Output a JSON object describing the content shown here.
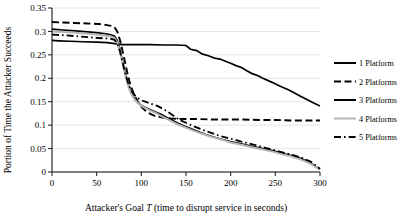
{
  "chart_data": {
    "type": "line",
    "title": "",
    "xlabel": "Attacker's Goal T (time to disrupt service in seconds)",
    "xlabel_parts": {
      "pre": "Attacker's Goal ",
      "italic": "T",
      "post": " (time to disrupt service in seconds)"
    },
    "ylabel": "Portion of Time the Attacker Succeeds",
    "xlim": [
      0,
      300
    ],
    "ylim": [
      0,
      0.35
    ],
    "xticks": [
      0,
      50,
      100,
      150,
      200,
      250,
      300
    ],
    "xticklabels": [
      "0",
      "50",
      "100",
      "150",
      "200",
      "250",
      "300"
    ],
    "yticks": [
      0,
      0.05,
      0.1,
      0.15,
      0.2,
      0.25,
      0.3,
      0.35
    ],
    "yticklabels": [
      "0",
      "0.05",
      "0.1",
      "0.15",
      "0.2",
      "0.25",
      "0.3",
      "0.35"
    ],
    "grid": "horizontal",
    "legend_position": "right",
    "series": [
      {
        "name": "1 Platform",
        "style": "solid",
        "color": "#000000",
        "width": 1.7,
        "points": [
          [
            0,
            0.281
          ],
          [
            8,
            0.28
          ],
          [
            20,
            0.279
          ],
          [
            35,
            0.278
          ],
          [
            50,
            0.277
          ],
          [
            62,
            0.276
          ],
          [
            70,
            0.274
          ],
          [
            78,
            0.272
          ],
          [
            95,
            0.272
          ],
          [
            110,
            0.272
          ],
          [
            125,
            0.271
          ],
          [
            140,
            0.271
          ],
          [
            150,
            0.27
          ],
          [
            155,
            0.262
          ],
          [
            162,
            0.259
          ],
          [
            168,
            0.252
          ],
          [
            175,
            0.248
          ],
          [
            182,
            0.243
          ],
          [
            188,
            0.241
          ],
          [
            195,
            0.236
          ],
          [
            200,
            0.232
          ],
          [
            206,
            0.227
          ],
          [
            212,
            0.223
          ],
          [
            218,
            0.216
          ],
          [
            224,
            0.21
          ],
          [
            230,
            0.206
          ],
          [
            236,
            0.2
          ],
          [
            242,
            0.195
          ],
          [
            248,
            0.19
          ],
          [
            252,
            0.186
          ],
          [
            258,
            0.181
          ],
          [
            264,
            0.176
          ],
          [
            270,
            0.17
          ],
          [
            276,
            0.164
          ],
          [
            282,
            0.158
          ],
          [
            288,
            0.152
          ],
          [
            294,
            0.146
          ],
          [
            300,
            0.141
          ]
        ]
      },
      {
        "name": "2 Platforms",
        "style": "dashed",
        "color": "#000000",
        "width": 1.9,
        "points": [
          [
            0,
            0.32
          ],
          [
            12,
            0.319
          ],
          [
            25,
            0.318
          ],
          [
            40,
            0.317
          ],
          [
            52,
            0.316
          ],
          [
            60,
            0.314
          ],
          [
            66,
            0.312
          ],
          [
            70,
            0.309
          ],
          [
            73,
            0.3
          ],
          [
            76,
            0.282
          ],
          [
            79,
            0.258
          ],
          [
            82,
            0.232
          ],
          [
            85,
            0.206
          ],
          [
            88,
            0.184
          ],
          [
            92,
            0.165
          ],
          [
            96,
            0.15
          ],
          [
            100,
            0.139
          ],
          [
            105,
            0.13
          ],
          [
            110,
            0.124
          ],
          [
            116,
            0.119
          ],
          [
            124,
            0.116
          ],
          [
            134,
            0.114
          ],
          [
            148,
            0.113
          ],
          [
            162,
            0.113
          ],
          [
            178,
            0.112
          ],
          [
            196,
            0.112
          ],
          [
            214,
            0.112
          ],
          [
            232,
            0.111
          ],
          [
            250,
            0.111
          ],
          [
            268,
            0.11
          ],
          [
            285,
            0.11
          ],
          [
            300,
            0.11
          ]
        ]
      },
      {
        "name": "3 Platforms",
        "style": "solid",
        "color": "#000000",
        "width": 1.7,
        "points": [
          [
            0,
            0.305
          ],
          [
            12,
            0.303
          ],
          [
            26,
            0.301
          ],
          [
            40,
            0.299
          ],
          [
            52,
            0.297
          ],
          [
            60,
            0.295
          ],
          [
            66,
            0.293
          ],
          [
            70,
            0.29
          ],
          [
            73,
            0.281
          ],
          [
            76,
            0.262
          ],
          [
            79,
            0.236
          ],
          [
            82,
            0.211
          ],
          [
            85,
            0.189
          ],
          [
            88,
            0.172
          ],
          [
            92,
            0.158
          ],
          [
            96,
            0.148
          ],
          [
            100,
            0.142
          ],
          [
            105,
            0.137
          ],
          [
            110,
            0.133
          ],
          [
            116,
            0.128
          ],
          [
            122,
            0.123
          ],
          [
            128,
            0.117
          ],
          [
            134,
            0.111
          ],
          [
            140,
            0.105
          ],
          [
            148,
            0.098
          ],
          [
            156,
            0.092
          ],
          [
            164,
            0.086
          ],
          [
            172,
            0.08
          ],
          [
            180,
            0.075
          ],
          [
            190,
            0.07
          ],
          [
            200,
            0.065
          ],
          [
            212,
            0.06
          ],
          [
            224,
            0.055
          ],
          [
            236,
            0.05
          ],
          [
            248,
            0.045
          ],
          [
            258,
            0.04
          ],
          [
            268,
            0.035
          ],
          [
            278,
            0.029
          ],
          [
            288,
            0.021
          ],
          [
            295,
            0.012
          ],
          [
            300,
            0.006
          ]
        ]
      },
      {
        "name": "4 Platforms",
        "style": "solid",
        "color": "#b5b5b5",
        "width": 2.0,
        "points": [
          [
            0,
            0.3
          ],
          [
            12,
            0.299
          ],
          [
            26,
            0.297
          ],
          [
            40,
            0.295
          ],
          [
            52,
            0.293
          ],
          [
            60,
            0.291
          ],
          [
            66,
            0.289
          ],
          [
            70,
            0.286
          ],
          [
            73,
            0.277
          ],
          [
            76,
            0.258
          ],
          [
            79,
            0.232
          ],
          [
            82,
            0.207
          ],
          [
            85,
            0.186
          ],
          [
            88,
            0.169
          ],
          [
            92,
            0.156
          ],
          [
            96,
            0.147
          ],
          [
            100,
            0.141
          ],
          [
            105,
            0.136
          ],
          [
            110,
            0.131
          ],
          [
            116,
            0.126
          ],
          [
            122,
            0.12
          ],
          [
            128,
            0.114
          ],
          [
            134,
            0.108
          ],
          [
            140,
            0.102
          ],
          [
            148,
            0.096
          ],
          [
            156,
            0.09
          ],
          [
            164,
            0.084
          ],
          [
            172,
            0.079
          ],
          [
            180,
            0.074
          ],
          [
            190,
            0.069
          ],
          [
            200,
            0.063
          ],
          [
            212,
            0.058
          ],
          [
            224,
            0.053
          ],
          [
            236,
            0.048
          ],
          [
            248,
            0.043
          ],
          [
            258,
            0.038
          ],
          [
            268,
            0.033
          ],
          [
            278,
            0.027
          ],
          [
            288,
            0.019
          ],
          [
            295,
            0.011
          ],
          [
            300,
            0.005
          ]
        ]
      },
      {
        "name": "5 Platforms",
        "style": "dashdot",
        "color": "#000000",
        "width": 1.8,
        "points": [
          [
            0,
            0.293
          ],
          [
            12,
            0.292
          ],
          [
            26,
            0.29
          ],
          [
            40,
            0.288
          ],
          [
            52,
            0.286
          ],
          [
            60,
            0.285
          ],
          [
            66,
            0.284
          ],
          [
            70,
            0.282
          ],
          [
            73,
            0.275
          ],
          [
            76,
            0.258
          ],
          [
            79,
            0.234
          ],
          [
            82,
            0.21
          ],
          [
            85,
            0.191
          ],
          [
            88,
            0.176
          ],
          [
            92,
            0.165
          ],
          [
            96,
            0.158
          ],
          [
            100,
            0.153
          ],
          [
            106,
            0.149
          ],
          [
            112,
            0.145
          ],
          [
            118,
            0.141
          ],
          [
            124,
            0.135
          ],
          [
            130,
            0.128
          ],
          [
            136,
            0.12
          ],
          [
            142,
            0.112
          ],
          [
            150,
            0.105
          ],
          [
            158,
            0.098
          ],
          [
            166,
            0.092
          ],
          [
            174,
            0.086
          ],
          [
            182,
            0.081
          ],
          [
            190,
            0.076
          ],
          [
            200,
            0.071
          ],
          [
            210,
            0.066
          ],
          [
            220,
            0.061
          ],
          [
            230,
            0.056
          ],
          [
            240,
            0.051
          ],
          [
            250,
            0.046
          ],
          [
            260,
            0.041
          ],
          [
            270,
            0.036
          ],
          [
            280,
            0.03
          ],
          [
            290,
            0.022
          ],
          [
            296,
            0.013
          ],
          [
            300,
            0.007
          ]
        ]
      }
    ],
    "legend": [
      {
        "label": "1 Platform",
        "style": "solid",
        "color": "#000000"
      },
      {
        "label": "2 Platforms",
        "style": "dashed",
        "color": "#000000"
      },
      {
        "label": "3 Platforms",
        "style": "solid",
        "color": "#000000"
      },
      {
        "label": "4 Platforms",
        "style": "solid",
        "color": "#b5b5b5"
      },
      {
        "label": "5 Platforms",
        "style": "dashdot",
        "color": "#000000"
      }
    ]
  }
}
